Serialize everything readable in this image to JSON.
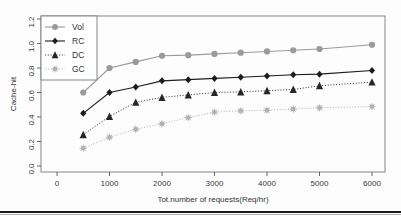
{
  "chart_data": {
    "type": "line",
    "title": "",
    "xlabel": "Tot.number of requests(Req/hr)",
    "ylabel": "Cache-hit",
    "xlim": [
      0,
      6200
    ],
    "ylim": [
      0.0,
      1.2
    ],
    "xticks": [
      0,
      1000,
      2000,
      3000,
      4000,
      5000,
      6000
    ],
    "xtick_labels": [
      "0",
      "1000",
      "2000",
      "3000",
      "4000",
      "5000",
      "6000"
    ],
    "yticks": [
      0.0,
      0.2,
      0.4,
      0.6,
      0.8,
      1.0,
      1.2
    ],
    "ytick_labels": [
      "0.0",
      "0.2",
      "0.4",
      "0.6",
      "0.8",
      "1.0",
      "1.2"
    ],
    "grid": false,
    "legend_position": "top-left",
    "x": [
      500,
      1000,
      1500,
      2000,
      2500,
      3000,
      3500,
      4000,
      4500,
      5000,
      6000
    ],
    "series": [
      {
        "name": "Vol",
        "marker": "circle",
        "linestyle": "solid",
        "color": "#9a9a9a",
        "values": [
          0.6,
          0.8,
          0.85,
          0.9,
          0.905,
          0.915,
          0.925,
          0.935,
          0.945,
          0.955,
          0.99
        ]
      },
      {
        "name": "RC",
        "marker": "diamond",
        "linestyle": "solid",
        "color": "#1c1c1c",
        "values": [
          0.43,
          0.6,
          0.645,
          0.695,
          0.705,
          0.715,
          0.725,
          0.735,
          0.745,
          0.75,
          0.78
        ]
      },
      {
        "name": "DC",
        "marker": "triangle",
        "linestyle": "dotted",
        "color": "#262626",
        "values": [
          0.255,
          0.405,
          0.52,
          0.56,
          0.58,
          0.6,
          0.605,
          0.615,
          0.625,
          0.655,
          0.685
        ]
      },
      {
        "name": "GC",
        "marker": "star",
        "linestyle": "dotted",
        "color": "#b0b0b0",
        "values": [
          0.145,
          0.235,
          0.3,
          0.345,
          0.395,
          0.44,
          0.45,
          0.455,
          0.465,
          0.475,
          0.485
        ]
      }
    ]
  },
  "legend": {
    "entries": [
      {
        "label": "Vol"
      },
      {
        "label": "RC"
      },
      {
        "label": "DC"
      },
      {
        "label": "GC"
      }
    ]
  },
  "colors": {
    "vol": "#9a9a9a",
    "rc": "#1c1c1c",
    "dc": "#262626",
    "gc": "#b0b0b0",
    "axis": "#555555",
    "box": "#7a7a7a"
  }
}
